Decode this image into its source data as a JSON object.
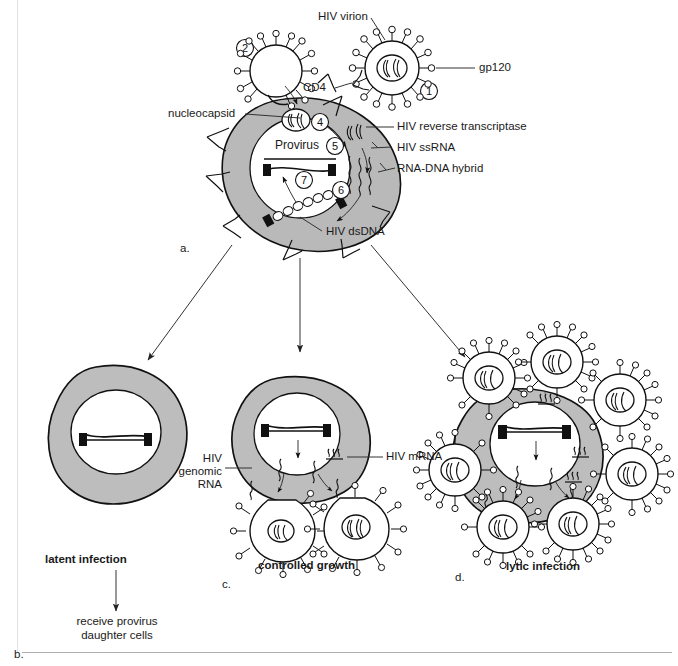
{
  "figure": {
    "title_alt": "HIV replication cycle diagram",
    "panel_keys": {
      "a": "a.",
      "b": "b.",
      "c": "c.",
      "d": "d."
    }
  },
  "panel_a": {
    "labels": {
      "hiv_virion": "HIV virion",
      "gp120": "gp120",
      "cd4": "CD4",
      "nucleocapsid": "nucleocapsid",
      "reverse_transcriptase": "HIV reverse transcriptase",
      "ss_rna": "HIV ssRNA",
      "rna_dna_hybrid": "RNA-DNA hybrid",
      "ds_dna": "HIV dsDNA",
      "provirus": "Provirus"
    },
    "steps": [
      "1",
      "2",
      "3",
      "4",
      "5",
      "6",
      "7"
    ]
  },
  "panel_b": {
    "caption": "latent infection",
    "outcome_line1": "receive provirus",
    "outcome_line2": "daughter cells"
  },
  "panel_c": {
    "caption": "controlled growth",
    "labels": {
      "genomic_rna_line1": "HIV",
      "genomic_rna_line2": "genomic",
      "genomic_rna_line3": "RNA",
      "mrna": "HIV mRNA"
    }
  },
  "panel_d": {
    "caption": "lytic infection"
  },
  "colors": {
    "cytoplasm_gray": "#b9b9b9",
    "nucleus_white": "#ffffff",
    "outline_black": "#111111",
    "leader_line": "#333333",
    "rule_gray": "#b0b0b0"
  }
}
